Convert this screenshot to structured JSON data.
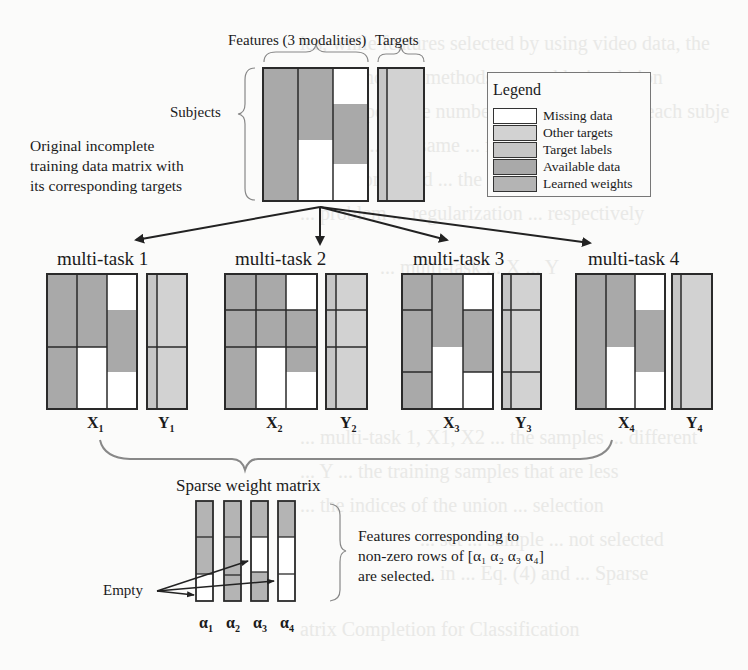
{
  "colors": {
    "missing": "#ffffff",
    "other_targets": "#d2d2d2",
    "target_labels": "#c6c6c6",
    "available": "#a9a9a9",
    "learned_weights": "#b4b4b4",
    "border": "#2a2a2a"
  },
  "background_ghost_text": [
    "les, while features selected by using video data, the",
    "(SK) ... normal methods ... to add stimulation",
    "... an impossible number of samples ... For each subje",
    "samples ... the same ... feature",
    "... and compared ... the",
    "... problem ... regularization ... respectively",
    "... multi-task ... X ... Y",
    "... multi-task 1, X1, X2 ... the samples ... different",
    "... Y ... the training samples that are less",
    "... the indices of the union ... selection",
    "... set ... sample ... not selected",
    "... in ... Eq. (4) and ... Sparse",
    "atrix Completion for Classification"
  ],
  "top": {
    "features_label": "Features (3 modalities)",
    "targets_label": "Targets",
    "subjects_label": "Subjects",
    "description": [
      "Original incomplete",
      "training data matrix with",
      "its corresponding targets"
    ]
  },
  "legend": {
    "title": "Legend",
    "items": [
      {
        "label": "Missing data",
        "color_key": "missing"
      },
      {
        "label": "Other targets",
        "color_key": "other_targets"
      },
      {
        "label": "Target labels",
        "color_key": "target_labels"
      },
      {
        "label": "Available data",
        "color_key": "available"
      },
      {
        "label": "Learned weights",
        "color_key": "learned_weights"
      }
    ]
  },
  "tasks": [
    {
      "title": "multi-task 1",
      "x_label": "X",
      "x_sub": "1",
      "y_label": "Y",
      "y_sub": "1"
    },
    {
      "title": "multi-task 2",
      "x_label": "X",
      "x_sub": "2",
      "y_label": "Y",
      "y_sub": "2"
    },
    {
      "title": "multi-task 3",
      "x_label": "X",
      "x_sub": "3",
      "y_label": "Y",
      "y_sub": "3"
    },
    {
      "title": "multi-task 4",
      "x_label": "X",
      "x_sub": "4",
      "y_label": "Y",
      "y_sub": "4"
    }
  ],
  "sparse": {
    "title": "Sparse weight matrix",
    "empty_label": "Empty",
    "columns": [
      {
        "label": "α",
        "sub": "1",
        "cells": [
          "learned",
          "learned",
          "missing"
        ]
      },
      {
        "label": "α",
        "sub": "2",
        "cells": [
          "learned",
          "learned",
          "learned"
        ]
      },
      {
        "label": "α",
        "sub": "3",
        "cells": [
          "learned",
          "missing",
          "learned"
        ]
      },
      {
        "label": "α",
        "sub": "4",
        "cells": [
          "learned",
          "missing",
          "missing"
        ]
      }
    ],
    "note_lines": [
      "Features corresponding to",
      "non-zero rows of [α₁ α₂ α₃ α₄]",
      "are selected."
    ]
  }
}
